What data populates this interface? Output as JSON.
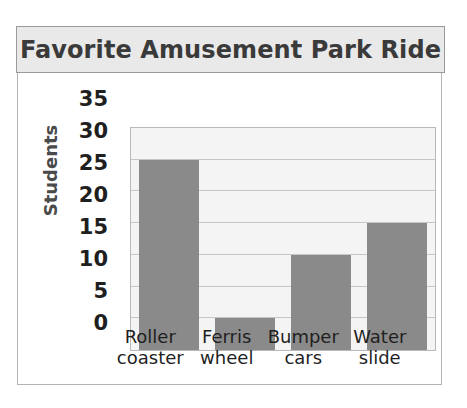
{
  "card": {
    "title": "Favorite Amusement Park Ride"
  },
  "axis": {
    "y_title": "Students",
    "y_ticks": [
      "35",
      "30",
      "25",
      "20",
      "15",
      "10",
      "5",
      "0"
    ]
  },
  "bars": [
    {
      "line1": "Roller",
      "line2": "coaster",
      "value": 30
    },
    {
      "line1": "Ferris",
      "line2": "wheel",
      "value": 5
    },
    {
      "line1": "Bumper",
      "line2": "cars",
      "value": 15
    },
    {
      "line1": "Water",
      "line2": "slide",
      "value": 20
    }
  ],
  "colors": {
    "bar": "#8a8a8a",
    "plot_background": "#f4f4f4",
    "gridline": "#c6c6c6",
    "frame": "#b4b4b4",
    "banner_background": "#e9e9e9",
    "title_text": "#3a3a3a"
  },
  "chart_data": {
    "type": "bar",
    "title": "Favorite Amusement Park Ride",
    "xlabel": "",
    "ylabel": "Students",
    "categories": [
      "Roller coaster",
      "Ferris wheel",
      "Bumper cars",
      "Water slide"
    ],
    "values": [
      30,
      5,
      15,
      20
    ],
    "ylim": [
      0,
      35
    ],
    "y_ticks": [
      0,
      5,
      10,
      15,
      20,
      25,
      30,
      35
    ],
    "grid": true,
    "legend": false,
    "orientation": "vertical",
    "bar_color": "#8a8a8a"
  }
}
